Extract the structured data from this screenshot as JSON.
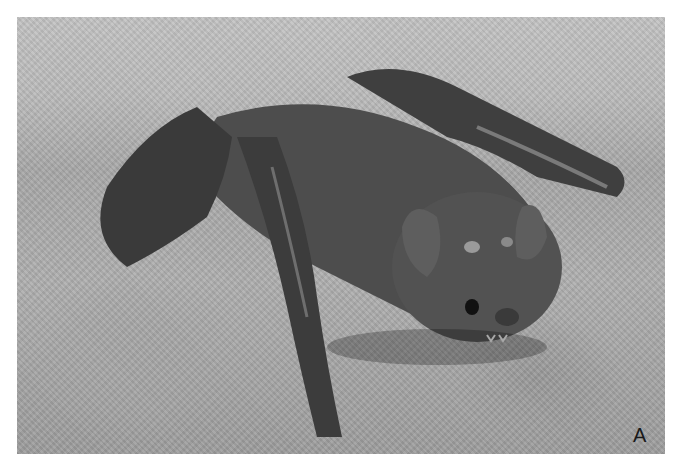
{
  "figure": {
    "panel_label": "A",
    "colors": {
      "background": "#ffffff",
      "bat_body": "#4a4a4a",
      "bat_dark": "#2e2e2e",
      "rock": "#b0b0b0",
      "label": "#1a1a1a"
    }
  }
}
